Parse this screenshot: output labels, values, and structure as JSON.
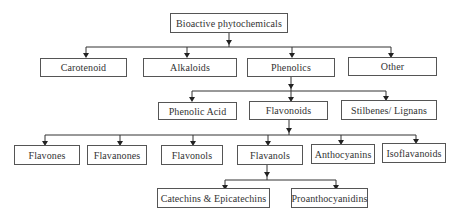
{
  "diagram": {
    "type": "hierarchy",
    "root": {
      "label": "Bioactive phytochemicals",
      "children": [
        {
          "label": "Carotenoid"
        },
        {
          "label": "Alkaloids"
        },
        {
          "label": "Phenolics",
          "children": [
            {
              "label": "Phenolic Acid"
            },
            {
              "label": "Flavonoids",
              "children": [
                {
                  "label": "Flavones"
                },
                {
                  "label": "Flavanones"
                },
                {
                  "label": "Flavonols"
                },
                {
                  "label": "Flavanols",
                  "children": [
                    {
                      "label": "Catechins & Epicatechins"
                    },
                    {
                      "label": "Proanthocyanidins"
                    }
                  ]
                },
                {
                  "label": "Anthocyanins"
                },
                {
                  "label": "Isoflavanoids"
                }
              ]
            },
            {
              "label": "Stilbenes/ Lignans"
            }
          ]
        },
        {
          "label": "Other"
        }
      ]
    }
  },
  "nodes": {
    "root": "Bioactive phytochemicals",
    "level1": [
      "Carotenoid",
      "Alkaloids",
      "Phenolics",
      "Other"
    ],
    "level2": [
      "Phenolic Acid",
      "Flavonoids",
      "Stilbenes/ Lignans"
    ],
    "level3": [
      "Flavones",
      "Flavanones",
      "Flavonols",
      "Flavanols",
      "Anthocyanins",
      "Isoflavanoids"
    ],
    "level4": [
      "Catechins & Epicatechins",
      "Proanthocyanidins"
    ]
  },
  "colors": {
    "border": "#555555",
    "text": "#333333",
    "line": "#333333",
    "background": "#ffffff"
  }
}
